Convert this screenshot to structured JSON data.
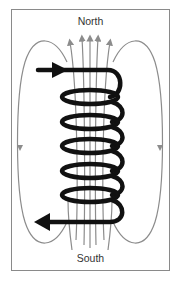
{
  "diagram": {
    "labels": {
      "top": "North",
      "bottom": "South"
    },
    "colors": {
      "coil": "#111111",
      "field_lines": "#8c8c8c",
      "frame": "#8a8a8a",
      "text": "#333333"
    },
    "coil_turns": 5,
    "current_direction": {
      "top": "into coil (rightward)",
      "bottom": "out of coil (leftward)"
    },
    "field_direction": {
      "inside": "upward toward North",
      "outside": "downward toward South"
    }
  }
}
